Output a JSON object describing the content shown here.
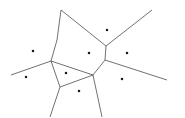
{
  "figure": {
    "kind": "voronoi-diagram",
    "caption": "",
    "width": 185,
    "height": 118,
    "background_color": "#ffffff"
  },
  "style": {
    "edge_color": "#4d4d4d",
    "edge_width": 0.8,
    "site_color": "#1a1a1a",
    "site_size": 2.2
  },
  "chart_data": {
    "type": "scatter",
    "xlabel": "",
    "ylabel": "",
    "grid": false,
    "legend": "none",
    "xlim": [
      0,
      185
    ],
    "ylim": [
      0,
      118
    ],
    "site_count": 8,
    "vertex_count": 6,
    "edge_count": 11,
    "sites": [
      {
        "id": "s1",
        "label": "",
        "x": 33,
        "y": 51
      },
      {
        "id": "s2",
        "label": "",
        "x": 26,
        "y": 77
      },
      {
        "id": "s3",
        "label": "",
        "x": 66,
        "y": 73
      },
      {
        "id": "s4",
        "label": "",
        "x": 79,
        "y": 91
      },
      {
        "id": "s5",
        "label": "",
        "x": 89,
        "y": 53
      },
      {
        "id": "s6",
        "label": "",
        "x": 107,
        "y": 30
      },
      {
        "id": "s7",
        "label": "",
        "x": 127,
        "y": 53
      },
      {
        "id": "s8",
        "label": "",
        "x": 122,
        "y": 79
      }
    ],
    "vertices": [
      {
        "id": "v1",
        "label": "",
        "x": 61,
        "y": 10
      },
      {
        "id": "v2",
        "label": "",
        "x": 106,
        "y": 46
      },
      {
        "id": "v3",
        "label": "",
        "x": 105,
        "y": 60
      },
      {
        "id": "v4",
        "label": "",
        "x": 51,
        "y": 61
      },
      {
        "id": "v5",
        "label": "",
        "x": 93,
        "y": 75
      },
      {
        "id": "v6",
        "label": "",
        "x": 60,
        "y": 87
      }
    ],
    "edges": [
      {
        "id": "e1",
        "kind": "bounded",
        "from": "v1",
        "to": "v4",
        "points": [
          [
            61,
            10
          ],
          [
            57,
            40
          ],
          [
            51,
            61
          ]
        ]
      },
      {
        "id": "e2",
        "kind": "bounded",
        "from": "v1",
        "to": "v2",
        "points": [
          [
            61,
            10
          ],
          [
            106,
            46
          ]
        ]
      },
      {
        "id": "e3",
        "kind": "bounded",
        "from": "v2",
        "to": "v3",
        "points": [
          [
            106,
            46
          ],
          [
            105,
            60
          ]
        ]
      },
      {
        "id": "e4",
        "kind": "bounded",
        "from": "v3",
        "to": "v5",
        "points": [
          [
            105,
            60
          ],
          [
            93,
            75
          ]
        ]
      },
      {
        "id": "e5",
        "kind": "bounded",
        "from": "v4",
        "to": "v5",
        "points": [
          [
            51,
            61
          ],
          [
            93,
            75
          ]
        ]
      },
      {
        "id": "e6",
        "kind": "bounded",
        "from": "v4",
        "to": "v6",
        "points": [
          [
            51,
            61
          ],
          [
            60,
            87
          ]
        ]
      },
      {
        "id": "e7",
        "kind": "bounded",
        "from": "v5",
        "to": "v6",
        "points": [
          [
            93,
            75
          ],
          [
            60,
            87
          ]
        ]
      },
      {
        "id": "e8",
        "kind": "unbounded",
        "from": "v2",
        "to": "top-right-edge",
        "points": [
          [
            106,
            46
          ],
          [
            152,
            10
          ]
        ]
      },
      {
        "id": "e9",
        "kind": "unbounded",
        "from": "v3",
        "to": "right-edge",
        "points": [
          [
            105,
            60
          ],
          [
            167,
            80
          ]
        ]
      },
      {
        "id": "e10",
        "kind": "unbounded",
        "from": "v4",
        "to": "left-edge",
        "points": [
          [
            51,
            61
          ],
          [
            11,
            75
          ]
        ]
      },
      {
        "id": "e11",
        "kind": "unbounded",
        "from": "v6",
        "to": "bottom-left-edge",
        "points": [
          [
            60,
            87
          ],
          [
            50,
            117
          ]
        ]
      },
      {
        "id": "e12",
        "kind": "unbounded",
        "from": "v5",
        "to": "bottom-edge",
        "points": [
          [
            93,
            75
          ],
          [
            102,
            117
          ]
        ]
      }
    ]
  }
}
